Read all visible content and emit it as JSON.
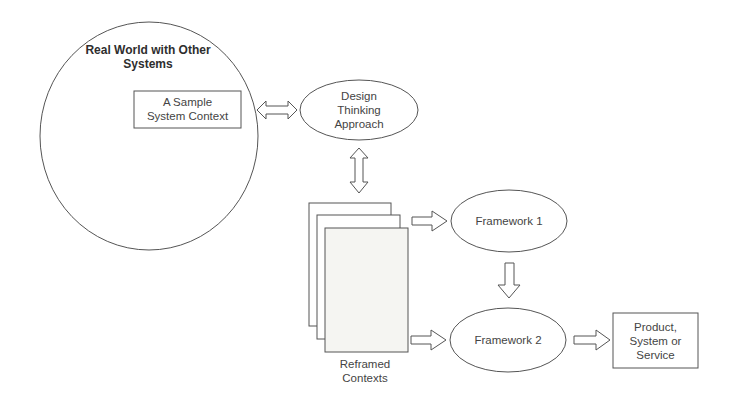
{
  "diagram": {
    "real_world": {
      "label_line1": "Real World with Other",
      "label_line2": "Systems"
    },
    "sample_context": {
      "line1": "A Sample",
      "line2": "System Context"
    },
    "design_thinking": {
      "line1": "Design",
      "line2": "Thinking",
      "line3": "Approach"
    },
    "reframed_contexts": {
      "line1": "Reframed",
      "line2": "Contexts"
    },
    "framework1": {
      "label": "Framework 1"
    },
    "framework2": {
      "label": "Framework 2"
    },
    "output": {
      "line1": "Product,",
      "line2": "System or",
      "line3": "Service"
    },
    "colors": {
      "stroke": "#555555",
      "fill": "#ffffff",
      "page_fill": "#f5f5f2"
    }
  }
}
